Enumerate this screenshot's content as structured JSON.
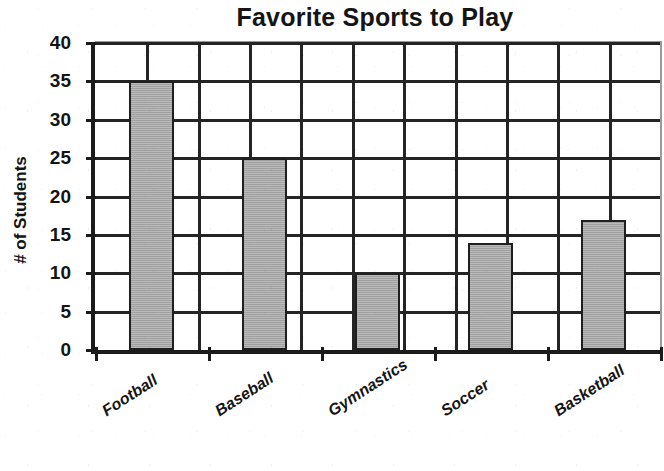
{
  "chart_data": {
    "type": "bar",
    "title": "Favorite Sports to Play",
    "xlabel": "",
    "ylabel": "# of Students",
    "categories": [
      "Football",
      "Baseball",
      "Gymnastics",
      "Soccer",
      "Basketball"
    ],
    "values": [
      35,
      25,
      10,
      14,
      17
    ],
    "ylim": [
      0,
      40
    ],
    "ytick_labels": [
      "40",
      "35",
      "30",
      "25",
      "20",
      "15",
      "10",
      "5",
      "0"
    ],
    "ytick_values": [
      40,
      35,
      30,
      25,
      20,
      15,
      10,
      5,
      0
    ],
    "ytick_step": 5,
    "grid": true,
    "grid_axes": "both",
    "vertical_gridline_count": 10,
    "legend": null,
    "legend_position": "none",
    "bar_color": "#a9a9a9",
    "bar_edge_color": "#1f1f1f",
    "axis_color": "#1b1b1b",
    "background_color": "#ffffff",
    "category_label_rotation": -33
  }
}
